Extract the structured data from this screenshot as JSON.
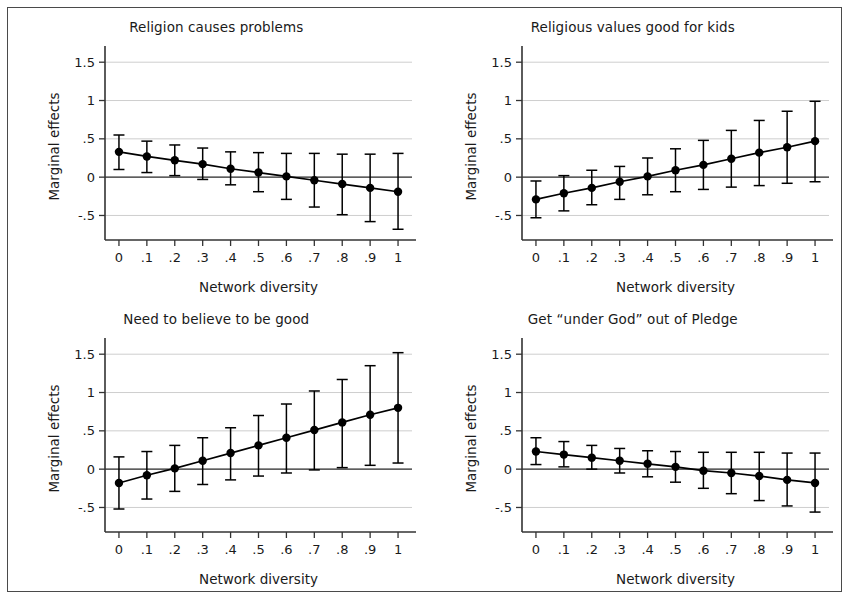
{
  "figure": {
    "border_color": "#4a4a4a",
    "background": "#ffffff",
    "marker_color": "#000000",
    "grid_color": "#c8c8c8",
    "axis_color": "#333333"
  },
  "axes_common": {
    "xlabel": "Network diversity",
    "ylabel": "Marginal effects",
    "xticks": [
      "0",
      ".1",
      ".2",
      ".3",
      ".4",
      ".5",
      ".6",
      ".7",
      ".8",
      ".9",
      "1"
    ],
    "xtick_values": [
      0,
      0.1,
      0.2,
      0.3,
      0.4,
      0.5,
      0.6,
      0.7,
      0.8,
      0.9,
      1
    ],
    "yticks": [
      "1.5",
      "1",
      ".5",
      "0",
      "-.5"
    ],
    "ytick_values": [
      1.5,
      1,
      0.5,
      0,
      -0.5
    ],
    "xlim": [
      -0.05,
      1.05
    ],
    "ylim": [
      -0.82,
      1.62
    ],
    "grid": "horizontal",
    "zero_reference_line": true,
    "legend": "none"
  },
  "chart_data": [
    {
      "type": "line",
      "panel": "top-left",
      "title": "Religion causes problems",
      "xlabel": "Network diversity",
      "ylabel": "Marginal effects",
      "xlim": [
        -0.05,
        1.05
      ],
      "ylim": [
        -0.82,
        1.62
      ],
      "grid": true,
      "x": [
        0,
        0.1,
        0.2,
        0.3,
        0.4,
        0.5,
        0.6,
        0.7,
        0.8,
        0.9,
        1
      ],
      "values": [
        0.33,
        0.27,
        0.22,
        0.17,
        0.11,
        0.06,
        0.01,
        -0.04,
        -0.09,
        -0.14,
        -0.19
      ],
      "ci_low": [
        0.1,
        0.06,
        0.02,
        -0.03,
        -0.1,
        -0.19,
        -0.29,
        -0.39,
        -0.49,
        -0.58,
        -0.68
      ],
      "ci_high": [
        0.55,
        0.47,
        0.42,
        0.38,
        0.33,
        0.32,
        0.31,
        0.31,
        0.3,
        0.3,
        0.31
      ],
      "series": [
        {
          "name": "Marginal effect",
          "values": [
            0.33,
            0.27,
            0.22,
            0.17,
            0.11,
            0.06,
            0.01,
            -0.04,
            -0.09,
            -0.14,
            -0.19
          ]
        }
      ]
    },
    {
      "type": "line",
      "panel": "top-right",
      "title": "Religious values good for kids",
      "xlabel": "Network diversity",
      "ylabel": "Marginal effects",
      "xlim": [
        -0.05,
        1.05
      ],
      "ylim": [
        -0.82,
        1.62
      ],
      "grid": true,
      "x": [
        0,
        0.1,
        0.2,
        0.3,
        0.4,
        0.5,
        0.6,
        0.7,
        0.8,
        0.9,
        1
      ],
      "values": [
        -0.29,
        -0.21,
        -0.14,
        -0.06,
        0.01,
        0.09,
        0.16,
        0.24,
        0.32,
        0.39,
        0.47
      ],
      "ci_low": [
        -0.53,
        -0.44,
        -0.36,
        -0.29,
        -0.23,
        -0.19,
        -0.16,
        -0.13,
        -0.11,
        -0.08,
        -0.06
      ],
      "ci_high": [
        -0.05,
        0.02,
        0.09,
        0.14,
        0.25,
        0.37,
        0.48,
        0.61,
        0.74,
        0.86,
        0.99
      ],
      "series": [
        {
          "name": "Marginal effect",
          "values": [
            -0.29,
            -0.21,
            -0.14,
            -0.06,
            0.01,
            0.09,
            0.16,
            0.24,
            0.32,
            0.39,
            0.47
          ]
        }
      ]
    },
    {
      "type": "line",
      "panel": "bottom-left",
      "title": "Need to believe to be good",
      "xlabel": "Network diversity",
      "ylabel": "Marginal effects",
      "xlim": [
        -0.05,
        1.05
      ],
      "ylim": [
        -0.82,
        1.62
      ],
      "grid": true,
      "x": [
        0,
        0.1,
        0.2,
        0.3,
        0.4,
        0.5,
        0.6,
        0.7,
        0.8,
        0.9,
        1
      ],
      "values": [
        -0.18,
        -0.08,
        0.01,
        0.11,
        0.21,
        0.31,
        0.41,
        0.51,
        0.61,
        0.71,
        0.8
      ],
      "ci_low": [
        -0.52,
        -0.39,
        -0.29,
        -0.2,
        -0.14,
        -0.09,
        -0.05,
        -0.01,
        0.02,
        0.05,
        0.08
      ],
      "ci_high": [
        0.16,
        0.23,
        0.31,
        0.41,
        0.54,
        0.7,
        0.85,
        1.02,
        1.17,
        1.35,
        1.52
      ],
      "series": [
        {
          "name": "Marginal effect",
          "values": [
            -0.18,
            -0.08,
            0.01,
            0.11,
            0.21,
            0.31,
            0.41,
            0.51,
            0.61,
            0.71,
            0.8
          ]
        }
      ]
    },
    {
      "type": "line",
      "panel": "bottom-right",
      "title": "Get “under God” out of Pledge",
      "xlabel": "Network diversity",
      "ylabel": "Marginal effects",
      "xlim": [
        -0.05,
        1.05
      ],
      "ylim": [
        -0.82,
        1.62
      ],
      "grid": true,
      "x": [
        0,
        0.1,
        0.2,
        0.3,
        0.4,
        0.5,
        0.6,
        0.7,
        0.8,
        0.9,
        1
      ],
      "values": [
        0.23,
        0.19,
        0.15,
        0.11,
        0.07,
        0.03,
        -0.02,
        -0.05,
        -0.09,
        -0.14,
        -0.18
      ],
      "ci_low": [
        0.06,
        0.03,
        0.0,
        -0.05,
        -0.1,
        -0.17,
        -0.25,
        -0.32,
        -0.41,
        -0.48,
        -0.56
      ],
      "ci_high": [
        0.41,
        0.36,
        0.31,
        0.27,
        0.24,
        0.23,
        0.22,
        0.22,
        0.22,
        0.21,
        0.21
      ],
      "series": [
        {
          "name": "Marginal effect",
          "values": [
            0.23,
            0.19,
            0.15,
            0.11,
            0.07,
            0.03,
            -0.02,
            -0.05,
            -0.09,
            -0.14,
            -0.18
          ]
        }
      ]
    }
  ]
}
